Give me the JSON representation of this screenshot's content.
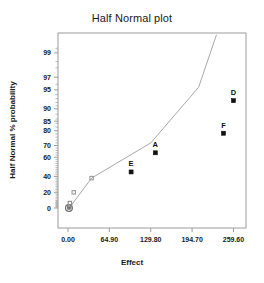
{
  "chart_data": {
    "type": "scatter",
    "title": "Half Normal plot",
    "xlabel": "Effect",
    "ylabel": "Half Normal % probability",
    "grid": false,
    "legend": null,
    "xlim": [
      0.0,
      273.0
    ],
    "ylim_probability": [
      0,
      99.5
    ],
    "xticks": [
      "0.00",
      "64.90",
      "129.80",
      "194.70",
      "259.60"
    ],
    "xtick_values": [
      0.0,
      64.9,
      129.8,
      194.7,
      259.6
    ],
    "yticks": [
      "0",
      "20",
      "40",
      "60",
      "70",
      "80",
      "85",
      "90",
      "95",
      "97",
      "99"
    ],
    "ytick_values": [
      0,
      20,
      40,
      60,
      70,
      80,
      85,
      90,
      95,
      97,
      99
    ],
    "points": [
      {
        "label": "",
        "effect": 1.5,
        "probability": 0.0,
        "marker": "circle-open",
        "color": "#6d6d6d",
        "highlighted": false
      },
      {
        "label": "",
        "effect": 2.0,
        "probability": 2.0,
        "marker": "square",
        "color": "#7d7d7d",
        "highlighted": false
      },
      {
        "label": "",
        "effect": 3.0,
        "probability": 6.5,
        "marker": "square",
        "color": "#8a8a8a",
        "highlighted": false
      },
      {
        "label": "",
        "effect": 9.0,
        "probability": 20.5,
        "marker": "square",
        "color": "#9a9a9a",
        "highlighted": false
      },
      {
        "label": "",
        "effect": 37.0,
        "probability": 38.0,
        "marker": "square",
        "color": "#9a9a9a",
        "highlighted": false
      },
      {
        "label": "E",
        "effect": 99.0,
        "probability": 45.0,
        "marker": "square-filled",
        "color": "#111111",
        "highlighted": true
      },
      {
        "label": "A",
        "effect": 137.0,
        "probability": 64.0,
        "marker": "square-filled",
        "color": "#111111",
        "highlighted": true
      },
      {
        "label": "F",
        "effect": 244.0,
        "probability": 78.5,
        "marker": "square-filled",
        "color": "#111111",
        "highlighted": true
      },
      {
        "label": "D",
        "effect": 259.6,
        "probability": 92.5,
        "marker": "square-filled",
        "color": "#111111",
        "highlighted": true
      }
    ],
    "reference_line": {
      "name": "half-normal reference line",
      "color": "#a8a8a8",
      "points": [
        {
          "effect": 2.0,
          "probability": 0.0
        },
        {
          "effect": 37.0,
          "probability": 38.0
        },
        {
          "effect": 130.0,
          "probability": 72.0
        },
        {
          "effect": 205.0,
          "probability": 95.5
        },
        {
          "effect": 233.0,
          "probability": 99.6
        }
      ]
    },
    "colors": {
      "axis": "#9c9c9c",
      "text": "#1a1a1a",
      "marker_highlight": "#111111",
      "marker_muted": "#9a9a9a",
      "line": "#a8a8a8",
      "background": "#ffffff"
    }
  }
}
